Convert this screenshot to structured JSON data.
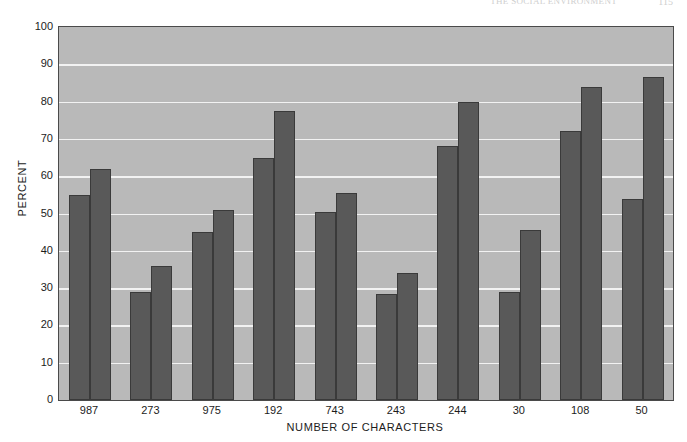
{
  "page_header": {
    "running_title": "THE SOCIAL ENVIRONMENT",
    "page_number": "115"
  },
  "chart_data": {
    "type": "bar",
    "title": "",
    "xlabel": "NUMBER OF CHARACTERS",
    "ylabel": "PERCENT",
    "categories": [
      "987",
      "273",
      "975",
      "192",
      "743",
      "243",
      "244",
      "30",
      "108",
      "50"
    ],
    "series": [
      {
        "name": "series-1",
        "values": [
          55,
          29,
          45,
          65,
          50.5,
          28.5,
          68,
          29,
          72,
          54
        ]
      },
      {
        "name": "series-2",
        "values": [
          62,
          36,
          51,
          77.5,
          55.5,
          34,
          80,
          45.5,
          84,
          86.5
        ]
      }
    ],
    "ylim": [
      0,
      100
    ],
    "yticks": [
      "0",
      "10",
      "20",
      "30",
      "40",
      "50",
      "60",
      "70",
      "80",
      "90",
      "100"
    ],
    "grid": true,
    "legend": "none",
    "colors": {
      "bar_fill": "#595959",
      "bar_edge": "#3a3a3a",
      "plot_background": "#b9b9b9",
      "gridline": "#f2f2f2",
      "axis": "#4a4a4a",
      "text": "#1c1c1c"
    }
  }
}
